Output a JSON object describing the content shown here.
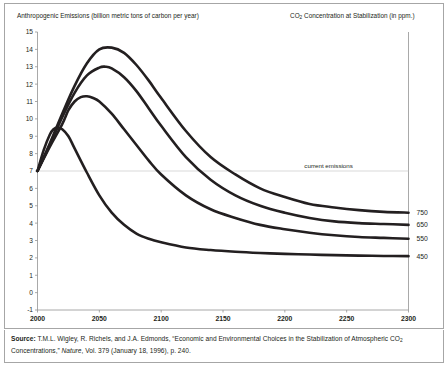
{
  "figure": {
    "left_axis_title": "Anthropogenic Emissions (billion metric tons of carbon per year)",
    "right_axis_title_pre": "CO",
    "right_axis_title_sub": "2",
    "right_axis_title_post": " Concentration at Stabilization (in ppm.)"
  },
  "source": {
    "label": "Source:",
    "text_line1_a": " T.M.L. Wigley, R. Richels, and J.A. Edmonds, “Economic and Environmental Choices in the Stabilization of Atmospheric CO",
    "text_line1_sub": "2",
    "text_line2_a": "Concentrations,” ",
    "text_line2_italic": "Nature",
    "text_line2_b": ", Vol. 379 (January 18, 1996), p. 240."
  },
  "chart_data": {
    "type": "line",
    "title": "",
    "xlabel": "",
    "ylabel": "Anthropogenic Emissions (billion metric tons of carbon per year)",
    "xlim": [
      2000,
      2300
    ],
    "ylim": [
      -1,
      15
    ],
    "xticks": [
      2000,
      2050,
      2100,
      2150,
      2200,
      2250,
      2300
    ],
    "yticks": [
      -1,
      0,
      1,
      2,
      3,
      4,
      5,
      6,
      7,
      8,
      9,
      10,
      11,
      12,
      13,
      14,
      15
    ],
    "grid": "horizontal-single",
    "legend_position": "right-end-labels",
    "annotations": [
      {
        "text": "current emissions",
        "x": 2255,
        "y": 7
      }
    ],
    "reference_lines": [
      {
        "orientation": "horizontal",
        "value": 7,
        "label": "current emissions"
      }
    ],
    "series": [
      {
        "name": "750",
        "label": "750",
        "end_label_value": 4.6,
        "points": [
          [
            2000,
            7.0
          ],
          [
            2010,
            8.6
          ],
          [
            2020,
            10.3
          ],
          [
            2030,
            11.9
          ],
          [
            2040,
            13.2
          ],
          [
            2050,
            14.0
          ],
          [
            2060,
            14.1
          ],
          [
            2070,
            13.8
          ],
          [
            2080,
            13.1
          ],
          [
            2090,
            12.2
          ],
          [
            2100,
            11.2
          ],
          [
            2120,
            9.3
          ],
          [
            2140,
            7.8
          ],
          [
            2160,
            6.8
          ],
          [
            2180,
            6.0
          ],
          [
            2200,
            5.5
          ],
          [
            2220,
            5.1
          ],
          [
            2240,
            4.9
          ],
          [
            2260,
            4.75
          ],
          [
            2280,
            4.65
          ],
          [
            2300,
            4.6
          ]
        ]
      },
      {
        "name": "650",
        "label": "650",
        "end_label_value": 3.9,
        "points": [
          [
            2000,
            7.0
          ],
          [
            2010,
            8.5
          ],
          [
            2020,
            10.1
          ],
          [
            2030,
            11.5
          ],
          [
            2040,
            12.5
          ],
          [
            2050,
            12.95
          ],
          [
            2055,
            13.0
          ],
          [
            2060,
            12.9
          ],
          [
            2070,
            12.4
          ],
          [
            2080,
            11.6
          ],
          [
            2090,
            10.6
          ],
          [
            2100,
            9.6
          ],
          [
            2120,
            7.8
          ],
          [
            2140,
            6.5
          ],
          [
            2160,
            5.6
          ],
          [
            2180,
            5.0
          ],
          [
            2200,
            4.6
          ],
          [
            2220,
            4.3
          ],
          [
            2240,
            4.1
          ],
          [
            2260,
            4.0
          ],
          [
            2280,
            3.95
          ],
          [
            2300,
            3.9
          ]
        ]
      },
      {
        "name": "550",
        "label": "550",
        "end_label_value": 3.1,
        "points": [
          [
            2000,
            7.0
          ],
          [
            2010,
            8.4
          ],
          [
            2020,
            9.7
          ],
          [
            2025,
            10.5
          ],
          [
            2030,
            11.0
          ],
          [
            2035,
            11.25
          ],
          [
            2040,
            11.3
          ],
          [
            2045,
            11.2
          ],
          [
            2050,
            11.0
          ],
          [
            2060,
            10.3
          ],
          [
            2070,
            9.4
          ],
          [
            2080,
            8.5
          ],
          [
            2090,
            7.6
          ],
          [
            2100,
            6.8
          ],
          [
            2120,
            5.6
          ],
          [
            2140,
            4.8
          ],
          [
            2160,
            4.3
          ],
          [
            2180,
            3.9
          ],
          [
            2200,
            3.65
          ],
          [
            2220,
            3.45
          ],
          [
            2240,
            3.3
          ],
          [
            2260,
            3.2
          ],
          [
            2280,
            3.15
          ],
          [
            2300,
            3.1
          ]
        ]
      },
      {
        "name": "450",
        "label": "450",
        "end_label_value": 2.1,
        "points": [
          [
            2000,
            7.0
          ],
          [
            2005,
            8.2
          ],
          [
            2010,
            9.1
          ],
          [
            2013,
            9.4
          ],
          [
            2016,
            9.5
          ],
          [
            2020,
            9.4
          ],
          [
            2025,
            9.0
          ],
          [
            2030,
            8.3
          ],
          [
            2040,
            6.9
          ],
          [
            2050,
            5.6
          ],
          [
            2060,
            4.6
          ],
          [
            2070,
            3.9
          ],
          [
            2080,
            3.4
          ],
          [
            2090,
            3.1
          ],
          [
            2100,
            2.9
          ],
          [
            2120,
            2.6
          ],
          [
            2140,
            2.45
          ],
          [
            2160,
            2.35
          ],
          [
            2180,
            2.28
          ],
          [
            2200,
            2.23
          ],
          [
            2220,
            2.19
          ],
          [
            2240,
            2.16
          ],
          [
            2260,
            2.13
          ],
          [
            2280,
            2.11
          ],
          [
            2300,
            2.1
          ]
        ]
      }
    ]
  }
}
